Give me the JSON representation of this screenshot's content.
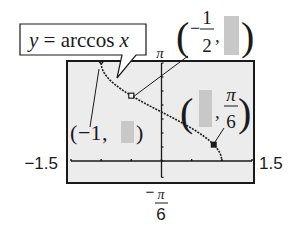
{
  "chart_data": {
    "type": "line",
    "title": "",
    "function_label": "y = arccos x",
    "function_label_parts": {
      "y": "y",
      "eq": " = ",
      "func": "arccos ",
      "x": "x"
    },
    "xlim": [
      -1.5,
      1.5
    ],
    "ylim": [
      -0.5236,
      3.1416
    ],
    "xlabel": "",
    "ylabel": "",
    "x_tick_labels": {
      "min": "−1.5",
      "max": "1.5"
    },
    "y_tick_labels": {
      "max": "π",
      "min_num": "π",
      "min_den": "6",
      "min_sign": "−"
    },
    "x_ticks": [
      -1.5,
      -1,
      -0.5,
      0,
      0.5,
      1,
      1.5
    ],
    "y_ticks_count": 7,
    "series": [
      {
        "name": "y = arccos x",
        "domain": [
          -1,
          1
        ],
        "style": "dotted",
        "function": "arccos"
      }
    ],
    "points": [
      {
        "name": "point-neg-one",
        "x": -1,
        "y": 3.1416,
        "marker": "tick",
        "label_parts": {
          "open": "(",
          "x": "−1",
          "sep": ", ",
          "y_hidden": true,
          "close": ")"
        }
      },
      {
        "name": "point-neg-half",
        "x": -0.5,
        "y": 2.0944,
        "marker": "open-square",
        "label_parts": {
          "open": "(",
          "x_sign": "−",
          "x_num": "1",
          "x_den": "2",
          "sep": ",",
          "y_hidden": true,
          "close": ")"
        }
      },
      {
        "name": "point-pi-sixth",
        "x": 0.866,
        "y": 0.5236,
        "marker": "filled-square",
        "label_parts": {
          "open": "(",
          "x_hidden": true,
          "sep": ",",
          "y_num": "π",
          "y_den": "6",
          "close": ")"
        }
      }
    ],
    "colors": {
      "screen_bg": "#ececec",
      "hidden_box": "#c8c8c8",
      "ink": "#1a1a1a"
    }
  }
}
